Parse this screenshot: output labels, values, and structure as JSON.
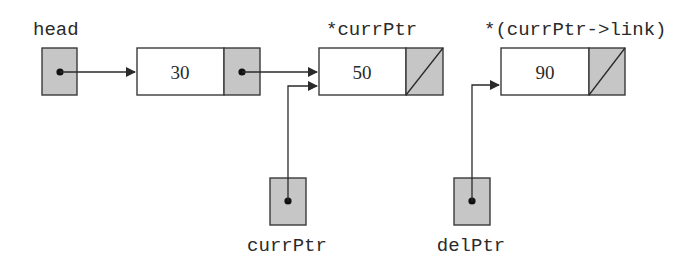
{
  "diagram": {
    "type": "singly-linked-list",
    "labels": {
      "head": "head",
      "node2_deref": "*currPtr",
      "node3_deref": "*(currPtr->link)",
      "curr_ptr": "currPtr",
      "del_ptr": "delPtr"
    },
    "nodes": [
      {
        "info": "30",
        "link": "pointer"
      },
      {
        "info": "50",
        "link": "null"
      },
      {
        "info": "90",
        "link": "null"
      }
    ],
    "pointers": [
      {
        "name": "head",
        "points_to": "node-30"
      },
      {
        "name": "currPtr",
        "points_to": "node-50"
      },
      {
        "name": "delPtr",
        "points_to": "node-90"
      }
    ],
    "colors": {
      "pointer_fill": "#c6c6c6",
      "node_fill": "#ffffff",
      "stroke": "#3a3a3a"
    }
  }
}
